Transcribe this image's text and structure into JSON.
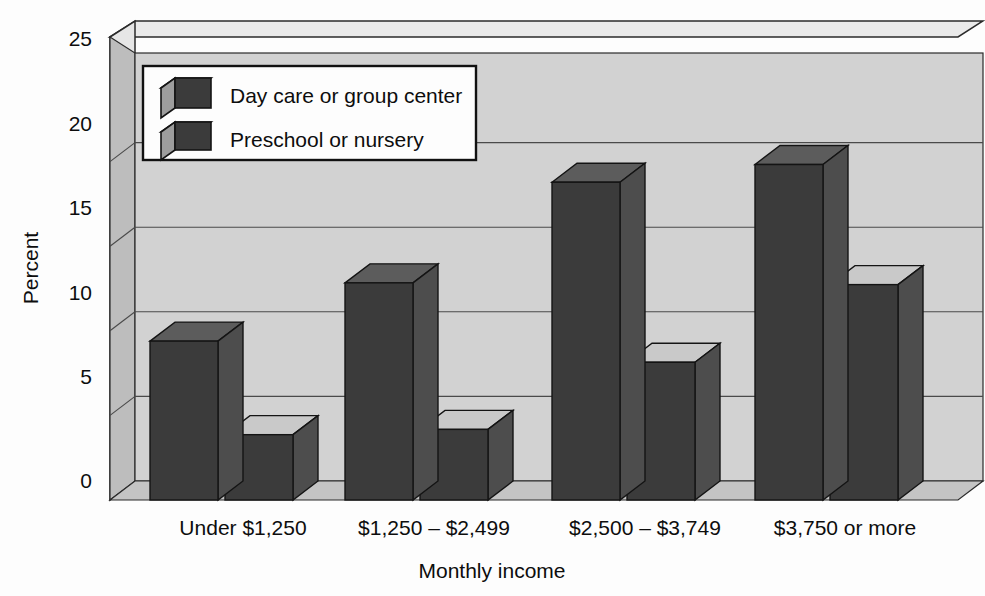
{
  "chart_data": {
    "type": "bar",
    "title": "",
    "subtitle": "",
    "xlabel": "Monthly income",
    "ylabel": "Percent",
    "categories": [
      "Under $1,250",
      "$1,250 – $2,499",
      "$2,500 – $3,749",
      "$3,750 or more"
    ],
    "series": [
      {
        "name": "Day care or group center",
        "values": [
          9,
          12.3,
          18,
          19
        ]
      },
      {
        "name": "Preschool or nursery",
        "values": [
          3.7,
          4,
          7.8,
          12.2
        ]
      }
    ],
    "ylim": [
      0,
      25
    ],
    "yticks": [
      "0",
      "5",
      "10",
      "15",
      "20",
      "25"
    ],
    "ytick_values": [
      0,
      5,
      10,
      15,
      20,
      25
    ],
    "grid": true,
    "legend_position": "top-left",
    "style": "3d-bar",
    "colors": {
      "bar_front": "#3b3b3b",
      "bar_side": "#4d4d4d",
      "bar_top_series1": "#5c5c5c",
      "bar_top_series2": "#c9c9c9",
      "plot_wall": "#d2d2d2",
      "plot_wall_side": "#bdbdbd",
      "plot_floor": "#c4c4c4",
      "frame_edge": "#e4e4e4",
      "gridline": "#4a4a4a",
      "legend_background": "#fdfdfd",
      "legend_border": "#111111",
      "page_background": "#fdfdfd",
      "text": "#0d0d0d"
    }
  },
  "legend": {
    "items": [
      {
        "label": "Day care or group center",
        "swatch": "cube-dark-top-icon"
      },
      {
        "label": "Preschool or nursery",
        "swatch": "cube-light-top-icon"
      }
    ]
  }
}
